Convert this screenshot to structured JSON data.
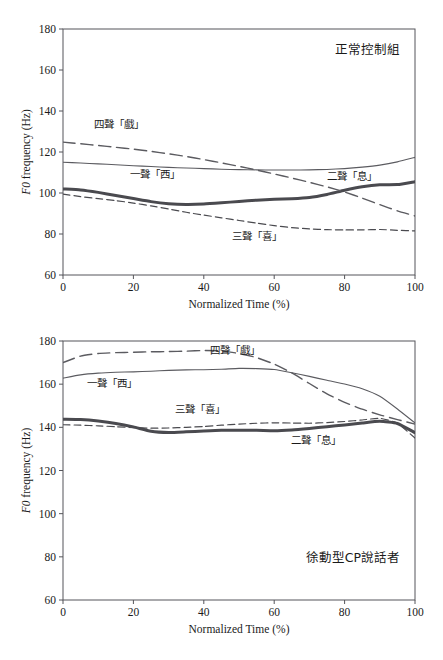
{
  "figure": {
    "axis": {
      "x_label": "Normalized Time (%)",
      "y_label_italic": "F0",
      "y_label_rest": " frequency (Hz)",
      "x_ticks": [
        "0",
        "20",
        "40",
        "60",
        "80",
        "100"
      ],
      "y_ticks": [
        "60",
        "80",
        "100",
        "120",
        "140",
        "160",
        "180"
      ]
    },
    "colors": {
      "axis": "#55555a",
      "tone1": "#5b5b60",
      "tone2": "#4a4a4f",
      "tone3": "#4a4a4f",
      "tone4": "#5b5b60",
      "text": "#1a1a1a"
    }
  },
  "chart_data": [
    {
      "type": "line",
      "panel": "top",
      "title": "正常控制組",
      "xlabel": "Normalized Time (%)",
      "ylabel": "F0 frequency (Hz)",
      "xlim": [
        0,
        100
      ],
      "ylim": [
        60,
        180
      ],
      "xticks": [
        0,
        20,
        40,
        60,
        80,
        100
      ],
      "yticks": [
        60,
        80,
        100,
        120,
        140,
        160,
        180
      ],
      "grid": false,
      "legend": "inline-annotations",
      "x": [
        0,
        5,
        10,
        15,
        20,
        25,
        30,
        35,
        40,
        45,
        50,
        55,
        60,
        65,
        70,
        75,
        80,
        85,
        90,
        95,
        100
      ],
      "series": [
        {
          "name": "一聲「西」",
          "label": "一聲「西」",
          "style": "solid-thin",
          "values": [
            115.0,
            114.6,
            114.2,
            113.8,
            113.3,
            112.9,
            112.5,
            112.2,
            111.9,
            111.6,
            111.4,
            111.3,
            111.2,
            111.2,
            111.3,
            111.5,
            111.9,
            112.6,
            113.6,
            115.2,
            117.4
          ],
          "label_x": 26,
          "label_y": 107.5
        },
        {
          "name": "二聲「息」",
          "label": "二聲「息」",
          "style": "solid-thick",
          "values": [
            102.0,
            101.5,
            100.3,
            98.8,
            97.3,
            95.8,
            94.8,
            94.4,
            94.6,
            95.2,
            95.9,
            96.5,
            96.9,
            97.2,
            97.8,
            99.3,
            101.3,
            103.0,
            104.0,
            104.1,
            105.5
          ],
          "label_x": 82,
          "label_y": 106.5
        },
        {
          "name": "三聲「喜」",
          "label": "三聲「喜」",
          "style": "dashed-short",
          "values": [
            99.5,
            98.2,
            97.3,
            96.3,
            95.1,
            93.7,
            92.2,
            90.6,
            89.2,
            87.9,
            86.6,
            85.3,
            84.1,
            83.1,
            82.5,
            82.1,
            82.0,
            82.0,
            82.2,
            81.8,
            81.5
          ],
          "label_x": 55,
          "label_y": 77.0
        },
        {
          "name": "四聲「戲」",
          "label": "四聲「戲」",
          "style": "dashed-long",
          "values": [
            124.8,
            124.0,
            123.2,
            122.3,
            121.4,
            120.3,
            119.1,
            117.8,
            116.3,
            114.7,
            113.0,
            111.2,
            109.3,
            107.3,
            105.2,
            103.0,
            100.5,
            97.5,
            94.3,
            91.3,
            88.8
          ],
          "label_x": 16,
          "label_y": 131.5
        }
      ]
    },
    {
      "type": "line",
      "panel": "bottom",
      "title": "徐動型CP說話者",
      "xlabel": "Normalized Time (%)",
      "ylabel": "F0 frequency (Hz)",
      "xlim": [
        0,
        100
      ],
      "ylim": [
        60,
        180
      ],
      "xticks": [
        0,
        20,
        40,
        60,
        80,
        100
      ],
      "yticks": [
        60,
        80,
        100,
        120,
        140,
        160,
        180
      ],
      "grid": false,
      "legend": "inline-annotations",
      "x": [
        0,
        5,
        10,
        15,
        20,
        25,
        30,
        35,
        40,
        45,
        50,
        55,
        60,
        65,
        70,
        75,
        80,
        85,
        90,
        95,
        100
      ],
      "series": [
        {
          "name": "一聲「西」",
          "label": "一聲「西」",
          "style": "solid-thin",
          "values": [
            162.8,
            164.3,
            165.1,
            165.5,
            165.7,
            166.0,
            166.4,
            166.6,
            166.7,
            166.9,
            167.3,
            167.2,
            166.8,
            165.3,
            163.6,
            161.8,
            160.1,
            157.9,
            154.4,
            148.5,
            142.0
          ],
          "label_x": 14,
          "label_y": 158.5
        },
        {
          "name": "二聲「息」",
          "label": "二聲「息」",
          "style": "solid-thick",
          "values": [
            143.8,
            143.6,
            142.9,
            141.8,
            140.2,
            138.2,
            137.6,
            137.9,
            138.3,
            138.6,
            138.6,
            138.6,
            138.4,
            138.8,
            139.5,
            140.3,
            141.1,
            142.0,
            142.8,
            141.8,
            137.5
          ],
          "label_x": 72,
          "label_y": 132.5
        },
        {
          "name": "三聲「喜」",
          "label": "三聲「喜」",
          "style": "dashed-short",
          "values": [
            141.2,
            141.0,
            140.7,
            140.3,
            139.9,
            139.6,
            139.7,
            140.0,
            140.4,
            141.0,
            141.5,
            141.9,
            142.1,
            142.0,
            141.9,
            142.2,
            142.7,
            143.4,
            144.2,
            141.9,
            135.0
          ],
          "label_x": 39,
          "label_y": 146.5
        },
        {
          "name": "四聲「戲」",
          "label": "四聲「戲」",
          "style": "dashed-long",
          "values": [
            170.0,
            173.0,
            174.2,
            174.6,
            174.8,
            175.0,
            175.1,
            175.3,
            175.6,
            175.4,
            174.2,
            172.3,
            169.3,
            165.2,
            160.3,
            155.5,
            151.6,
            148.4,
            145.8,
            143.6,
            141.5
          ],
          "label_x": 49,
          "label_y": 173.8
        }
      ]
    }
  ]
}
